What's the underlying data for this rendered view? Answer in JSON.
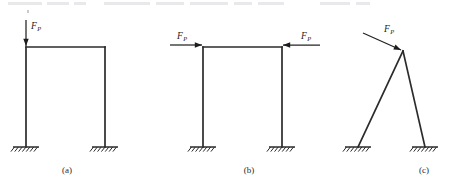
{
  "figure": {
    "background_color": "#ffffff",
    "stroke_color": "#2b2b2b",
    "force_label_text": "F",
    "force_label_subscript": "P",
    "support_type": "fixed-support-hatched",
    "panel_count": 3
  },
  "panels": [
    {
      "id": "a",
      "caption": "(a)",
      "structure": "portal-frame",
      "caption_x": 67,
      "caption_y": 173,
      "beam": {
        "x1": 26,
        "y1": 47,
        "x2": 105,
        "y2": 47
      },
      "columns": [
        {
          "x1": 26,
          "y1": 47,
          "x2": 26,
          "y2": 147
        },
        {
          "x1": 105,
          "y1": 47,
          "x2": 105,
          "y2": 147
        }
      ],
      "supports": [
        {
          "x": 26,
          "y": 147,
          "half_width": 13
        },
        {
          "x": 105,
          "y": 147,
          "half_width": 13
        }
      ],
      "forces": [
        {
          "name": "vertical-point-load",
          "direction": "down",
          "tail_x": 26,
          "tail_y": 20,
          "tip_x": 26,
          "tip_y": 46,
          "label_x": 31,
          "label_y": 29,
          "subscript_dx": 6.2,
          "subscript_dy": 2.2
        }
      ]
    },
    {
      "id": "b",
      "caption": "(b)",
      "structure": "portal-frame",
      "caption_x": 249,
      "caption_y": 173,
      "beam": {
        "x1": 203,
        "y1": 47,
        "x2": 282,
        "y2": 47
      },
      "columns": [
        {
          "x1": 203,
          "y1": 47,
          "x2": 203,
          "y2": 147
        },
        {
          "x1": 282,
          "y1": 47,
          "x2": 282,
          "y2": 147
        }
      ],
      "supports": [
        {
          "x": 203,
          "y": 147,
          "half_width": 13
        },
        {
          "x": 282,
          "y": 147,
          "half_width": 13
        }
      ],
      "forces": [
        {
          "name": "horizontal-load-left",
          "direction": "right",
          "tail_x": 170,
          "tail_y": 45,
          "tip_x": 202,
          "tip_y": 45,
          "label_x": 177,
          "label_y": 39,
          "subscript_dx": 6.2,
          "subscript_dy": 2.2
        },
        {
          "name": "horizontal-load-right",
          "direction": "left",
          "tail_x": 320,
          "tail_y": 45,
          "tip_x": 283,
          "tip_y": 45,
          "label_x": 301,
          "label_y": 39,
          "subscript_dx": 6.2,
          "subscript_dy": 2.2
        }
      ]
    },
    {
      "id": "c",
      "caption": "(c)",
      "structure": "a-frame",
      "caption_x": 424,
      "caption_y": 173,
      "apex": {
        "x": 403,
        "y": 51
      },
      "legs": [
        {
          "x1": 403,
          "y1": 51,
          "x2": 358,
          "y2": 147
        },
        {
          "x1": 403,
          "y1": 51,
          "x2": 425,
          "y2": 147
        }
      ],
      "supports": [
        {
          "x": 358,
          "y": 147,
          "half_width": 13
        },
        {
          "x": 425,
          "y": 147,
          "half_width": 13
        }
      ],
      "forces": [
        {
          "name": "inclined-load-apex",
          "direction": "down-right",
          "tail_x": 363,
          "tail_y": 33,
          "tip_x": 401,
          "tip_y": 50,
          "label_x": 384,
          "label_y": 32,
          "subscript_dx": 6.2,
          "subscript_dy": 2.2
        }
      ]
    }
  ],
  "scan_artifacts": {
    "description": "faint remnants of cropped text line along the top edge",
    "bars": [
      {
        "x": 8,
        "y": 2,
        "w": 34,
        "h": 3
      },
      {
        "x": 47,
        "y": 2,
        "w": 22,
        "h": 3
      },
      {
        "x": 74,
        "y": 2,
        "w": 12,
        "h": 3
      },
      {
        "x": 104,
        "y": 2,
        "w": 46,
        "h": 3
      },
      {
        "x": 156,
        "y": 2,
        "w": 28,
        "h": 3
      },
      {
        "x": 190,
        "y": 2,
        "w": 38,
        "h": 3
      },
      {
        "x": 234,
        "y": 2,
        "w": 18,
        "h": 3
      },
      {
        "x": 258,
        "y": 2,
        "w": 26,
        "h": 3
      },
      {
        "x": 320,
        "y": 2,
        "w": 30,
        "h": 3
      },
      {
        "x": 356,
        "y": 2,
        "w": 14,
        "h": 3
      }
    ],
    "specks": [
      {
        "x": 27,
        "y": 10,
        "w": 2,
        "h": 3
      }
    ]
  }
}
